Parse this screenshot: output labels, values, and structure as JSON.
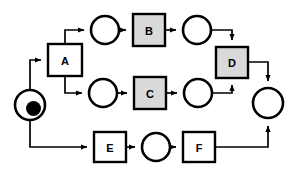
{
  "diagram": {
    "type": "workflow-petri-net",
    "colors": {
      "stroke": "#000000",
      "plain_fill": "#ffffff",
      "shaded_fill": "#d9d9d9",
      "background": "#ffffff",
      "token": "#000000"
    },
    "nodes": [
      {
        "id": "start",
        "kind": "start-place",
        "label": "",
        "shape": "circle-with-token",
        "cx": 30,
        "cy": 105,
        "r": 15
      },
      {
        "id": "A",
        "kind": "task",
        "label": "A",
        "shape": "box",
        "fill": "plain",
        "x": 48,
        "y": 44,
        "w": 34,
        "h": 32
      },
      {
        "id": "p1",
        "kind": "place",
        "label": "",
        "shape": "circle",
        "cx": 105,
        "cy": 30,
        "r": 14
      },
      {
        "id": "B",
        "kind": "task",
        "label": "B",
        "shape": "box",
        "fill": "shaded",
        "x": 133,
        "y": 14,
        "w": 32,
        "h": 32
      },
      {
        "id": "p2",
        "kind": "place",
        "label": "",
        "shape": "circle",
        "cx": 197,
        "cy": 30,
        "r": 14
      },
      {
        "id": "p3",
        "kind": "place",
        "label": "",
        "shape": "circle",
        "cx": 103,
        "cy": 93,
        "r": 14
      },
      {
        "id": "C",
        "kind": "task",
        "label": "C",
        "shape": "box",
        "fill": "shaded",
        "x": 134,
        "y": 77,
        "w": 32,
        "h": 32
      },
      {
        "id": "p4",
        "kind": "place",
        "label": "",
        "shape": "circle",
        "cx": 198,
        "cy": 93,
        "r": 14
      },
      {
        "id": "D",
        "kind": "task",
        "label": "D",
        "shape": "box",
        "fill": "shaded",
        "x": 216,
        "y": 47,
        "w": 32,
        "h": 31
      },
      {
        "id": "pend",
        "kind": "place",
        "label": "",
        "shape": "circle",
        "cx": 268,
        "cy": 103,
        "r": 15
      },
      {
        "id": "E",
        "kind": "task",
        "label": "E",
        "shape": "box",
        "fill": "plain",
        "x": 94,
        "y": 132,
        "w": 32,
        "h": 30
      },
      {
        "id": "p5",
        "kind": "place",
        "label": "",
        "shape": "circle",
        "cx": 156,
        "cy": 147,
        "r": 14
      },
      {
        "id": "F",
        "kind": "task",
        "label": "F",
        "shape": "box",
        "fill": "plain",
        "x": 183,
        "y": 132,
        "w": 32,
        "h": 30
      }
    ],
    "edges": [
      {
        "from": "start",
        "to": "A",
        "route": "start-up-to-A"
      },
      {
        "from": "A",
        "to": "p1",
        "route": "A-top-split-up-right"
      },
      {
        "from": "p1",
        "to": "B",
        "route": "straight-right"
      },
      {
        "from": "B",
        "to": "p2",
        "route": "straight-right"
      },
      {
        "from": "p2",
        "to": "D",
        "route": "right-then-down-into-D-top"
      },
      {
        "from": "A",
        "to": "p3",
        "route": "A-bottom-split-down-right"
      },
      {
        "from": "p3",
        "to": "C",
        "route": "straight-right"
      },
      {
        "from": "C",
        "to": "p4",
        "route": "straight-right"
      },
      {
        "from": "p4",
        "to": "D",
        "route": "right-then-up-into-D-bottom"
      },
      {
        "from": "D",
        "to": "pend",
        "route": "right-then-down-into-end-top"
      },
      {
        "from": "start",
        "to": "E",
        "route": "down-then-right"
      },
      {
        "from": "E",
        "to": "p5",
        "route": "straight-right"
      },
      {
        "from": "p5",
        "to": "F",
        "route": "straight-right"
      },
      {
        "from": "F",
        "to": "pend",
        "route": "right-then-up-into-end-bottom"
      }
    ],
    "labels": {
      "A": "A",
      "B": "B",
      "C": "C",
      "D": "D",
      "E": "E",
      "F": "F"
    }
  }
}
